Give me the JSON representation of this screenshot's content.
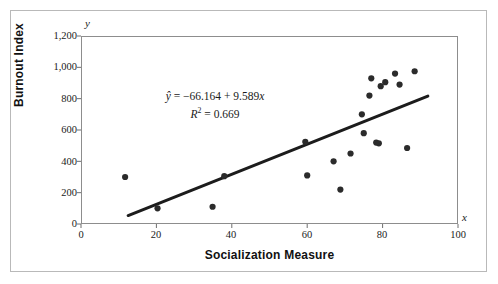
{
  "chart_data": {
    "type": "scatter",
    "title": "",
    "xlabel": "Socialization Measure",
    "ylabel": "Burnout Index",
    "x_axis_letter": "x",
    "y_axis_letter": "y",
    "xlim": [
      0,
      100
    ],
    "ylim": [
      0,
      1200
    ],
    "xticks": [
      0,
      20,
      40,
      60,
      80,
      100
    ],
    "xtick_labels": [
      "0",
      "20",
      "40",
      "60",
      "80",
      "100"
    ],
    "yticks": [
      0,
      200,
      400,
      600,
      800,
      1000,
      1200
    ],
    "ytick_labels": [
      "0",
      "200",
      "400",
      "600",
      "800",
      "1,000",
      "1,200"
    ],
    "grid": false,
    "legend": null,
    "annotations": [
      "ŷ = −66.164 + 9.589x",
      "R² = 0.669"
    ],
    "equation": {
      "intercept": -66.164,
      "slope": 9.589,
      "r_squared": 0.669,
      "line_1_prefix": "ŷ",
      "line_1_body": " = −66.164 + 9.589",
      "line_1_var": "x",
      "line_2_prefix": "R",
      "line_2_sup": "2",
      "line_2_body": " = 0.669"
    },
    "series": [
      {
        "name": "observations",
        "marker": "circle",
        "color": "#2b2b2b",
        "points": [
          [
            11.7,
            300
          ],
          [
            20.3,
            100
          ],
          [
            34.9,
            110
          ],
          [
            38.0,
            305
          ],
          [
            59.5,
            525
          ],
          [
            60.0,
            310
          ],
          [
            67.0,
            400
          ],
          [
            68.8,
            220
          ],
          [
            71.5,
            450
          ],
          [
            74.5,
            700
          ],
          [
            75.0,
            580
          ],
          [
            76.5,
            820
          ],
          [
            77.0,
            930
          ],
          [
            78.3,
            520
          ],
          [
            79.0,
            515
          ],
          [
            79.5,
            880
          ],
          [
            80.7,
            905
          ],
          [
            83.3,
            960
          ],
          [
            84.5,
            890
          ],
          [
            86.5,
            485
          ],
          [
            88.5,
            975
          ]
        ]
      }
    ],
    "fit_line": {
      "name": "least-squares regression line",
      "color": "#1c1c1c",
      "x_start": 12.5,
      "y_start": 54,
      "x_end": 92.0,
      "y_end": 816
    }
  }
}
